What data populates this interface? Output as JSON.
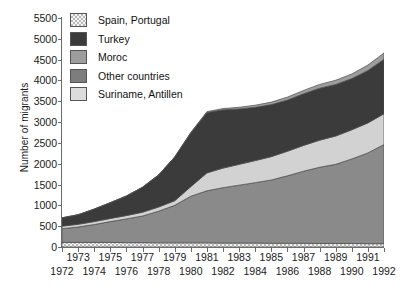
{
  "chart_data": {
    "type": "area",
    "title": "",
    "xlabel": "",
    "ylabel": "Number of migrants",
    "ylim": [
      0,
      5500
    ],
    "ytick_step": 500,
    "yticks": [
      5500,
      5000,
      4500,
      4000,
      3500,
      3000,
      2500,
      2000,
      1500,
      1000,
      500,
      0
    ],
    "grid": false,
    "stacked": true,
    "legend_position": "top-left",
    "x": [
      1972,
      1973,
      1974,
      1975,
      1976,
      1977,
      1978,
      1979,
      1980,
      1981,
      1982,
      1983,
      1984,
      1985,
      1986,
      1987,
      1988,
      1989,
      1990,
      1991,
      1992
    ],
    "x_labels_odd": [
      1973,
      1975,
      1977,
      1979,
      1981,
      1983,
      1985,
      1987,
      1989,
      1991
    ],
    "x_labels_even": [
      1972,
      1974,
      1976,
      1978,
      1980,
      1982,
      1984,
      1986,
      1988,
      1990,
      1992
    ],
    "stack_order_bottom_to_top": [
      "Spain, Portugal",
      "Other countries",
      "Suriname, Antillen",
      "Turkey",
      "Moroc"
    ],
    "series": [
      {
        "name": "Spain, Portugal",
        "color": "#e4e4e4",
        "pattern": "checker",
        "values": [
          110,
          110,
          110,
          110,
          105,
          105,
          100,
          100,
          100,
          100,
          95,
          95,
          95,
          90,
          90,
          90,
          85,
          85,
          85,
          80,
          80
        ]
      },
      {
        "name": "Other countries",
        "color": "#8a8a8a",
        "pattern": "solid",
        "values": [
          330,
          370,
          430,
          500,
          570,
          640,
          760,
          900,
          1120,
          1250,
          1330,
          1390,
          1450,
          1520,
          1620,
          1730,
          1830,
          1900,
          2030,
          2180,
          2380
        ]
      },
      {
        "name": "Suriname, Antillen",
        "color": "#d2d2d2",
        "pattern": "solid",
        "values": [
          60,
          65,
          70,
          75,
          80,
          90,
          100,
          110,
          230,
          430,
          470,
          500,
          530,
          560,
          590,
          620,
          650,
          680,
          700,
          720,
          740
        ]
      },
      {
        "name": "Turkey",
        "color": "#3b3b3b",
        "pattern": "solid",
        "values": [
          200,
          230,
          300,
          380,
          470,
          600,
          770,
          1050,
          1290,
          1450,
          1400,
          1330,
          1280,
          1250,
          1230,
          1240,
          1250,
          1240,
          1230,
          1260,
          1310
        ]
      },
      {
        "name": "Moroc",
        "color": "#9d9d9d",
        "pattern": "solid",
        "values": [
          0,
          0,
          0,
          0,
          0,
          0,
          0,
          0,
          10,
          20,
          30,
          40,
          50,
          60,
          70,
          80,
          90,
          100,
          110,
          130,
          150
        ]
      }
    ],
    "totals": [
      700,
      775,
      910,
      1065,
      1225,
      1435,
      1730,
      2160,
      2750,
      3250,
      3325,
      3355,
      3405,
      3480,
      3600,
      3760,
      3905,
      4005,
      4155,
      4370,
      4660
    ]
  },
  "legend": {
    "items": [
      {
        "label": "Spain, Portugal",
        "swatch": "checker",
        "color": "#e4e4e4"
      },
      {
        "label": "Turkey",
        "swatch": "solid",
        "color": "#3b3b3b"
      },
      {
        "label": "Moroc",
        "swatch": "solid",
        "color": "#9d9d9d"
      },
      {
        "label": "Other countries",
        "swatch": "solid",
        "color": "#7d7d7d"
      },
      {
        "label": "Suriname, Antillen",
        "swatch": "solid",
        "color": "#dcdcdc"
      }
    ]
  },
  "axes": {
    "y_title": "Number of migrants"
  }
}
